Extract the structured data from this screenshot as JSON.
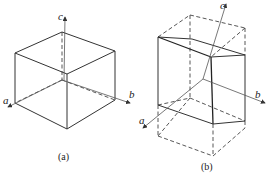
{
  "figures": [
    {
      "id": "a",
      "caption": "(a)",
      "axes": {
        "a": "a",
        "b": "b",
        "c": "c"
      },
      "description": "Cube unit cell with crystallographic axes a, b, c"
    },
    {
      "id": "b",
      "caption": "(b)",
      "axes": {
        "a": "a",
        "b": "b",
        "c": "c"
      },
      "description": "Dashed rectangular cell with inscribed solid sheared prism; axes a, b, c"
    }
  ],
  "colors": {
    "line": "#333333",
    "background": "#ffffff"
  }
}
